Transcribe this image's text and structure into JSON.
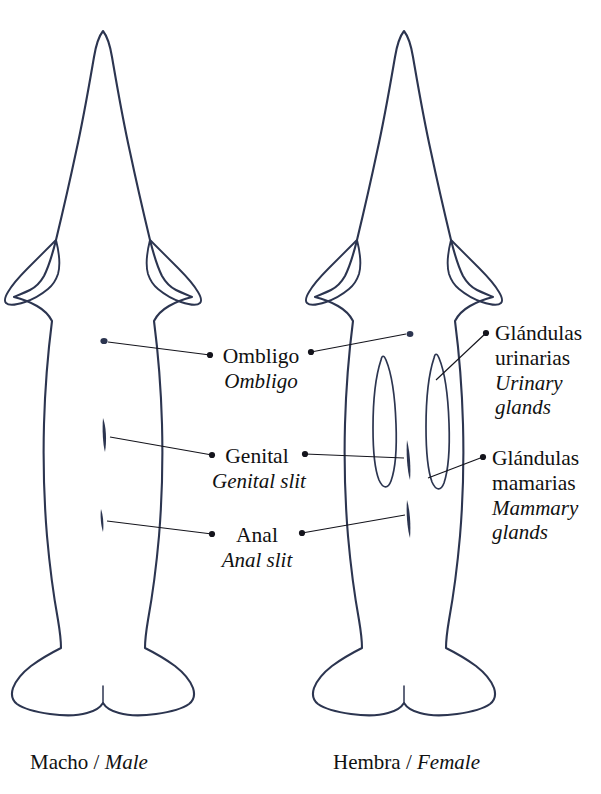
{
  "figure": {
    "title_visible": false,
    "background_color": "#ffffff",
    "ink_color": "#2c3550",
    "text_color": "#111111",
    "view": "ventral",
    "subjects": [
      {
        "id": "male",
        "caption_es": "Macho",
        "caption_en": "Male",
        "caption_separator": "/",
        "features": [
          "umbilicus",
          "genital-slit",
          "anal-slit"
        ]
      },
      {
        "id": "female",
        "caption_es": "Hembra",
        "caption_en": "Female",
        "caption_separator": "/",
        "features": [
          "umbilicus",
          "genital-slit",
          "anal-slit",
          "mammary-slits",
          "urinary-glands"
        ]
      }
    ]
  },
  "labels": {
    "umbilicus": {
      "es": "Ombligo",
      "en": "Ombligo"
    },
    "genital": {
      "es": "Genital",
      "en": "Genital slit"
    },
    "anal": {
      "es": "Anal",
      "en": "Anal slit"
    },
    "urinary_glands": {
      "es_line1": "Glándulas",
      "es_line2": "urinarias",
      "en_line1": "Urinary",
      "en_line2": "glands"
    },
    "mammary_glands": {
      "es_line1": "Glándulas",
      "es_line2": "mamarias",
      "en_line1": "Mammary",
      "en_line2": "glands"
    }
  },
  "captions": {
    "male": {
      "es": "Macho",
      "sep": " / ",
      "en": "Male"
    },
    "female": {
      "es": "Hembra",
      "sep": " / ",
      "en": "Female"
    }
  },
  "icons": {
    "leader_terminal": "bullet-dot"
  }
}
